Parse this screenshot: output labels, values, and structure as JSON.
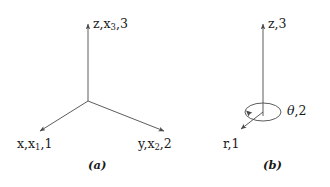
{
  "figure": {
    "background_color": "#ffffff",
    "line_color": "#4a4a4a",
    "text_color": "#1a1a1a"
  },
  "panel_a": {
    "caption": "(a)",
    "system": "cartesian",
    "axes": [
      {
        "name": "z-axis",
        "label_parts": {
          "pre": "z,x",
          "sub": "3",
          "post": ",3"
        },
        "label_text": "z,x3,3",
        "direction": "up"
      },
      {
        "name": "x-axis",
        "label_parts": {
          "pre": "x,x",
          "sub": "1",
          "post": ",1"
        },
        "label_text": "x,x1,1",
        "direction": "down-left"
      },
      {
        "name": "y-axis",
        "label_parts": {
          "pre": "y,x",
          "sub": "2",
          "post": ",2"
        },
        "label_text": "y,x2,2",
        "direction": "down-right"
      }
    ],
    "labels": {
      "z": {
        "pre": "z,x",
        "sub": "3",
        "post": ",3"
      },
      "x": {
        "pre": "x,x",
        "sub": "1",
        "post": ",1"
      },
      "y": {
        "pre": "y,x",
        "sub": "2",
        "post": ",2"
      }
    }
  },
  "panel_b": {
    "caption": "(b)",
    "system": "cylindrical",
    "axes": [
      {
        "name": "z-axis",
        "label_text": "z,3",
        "direction": "up"
      },
      {
        "name": "theta-axis",
        "label_text": "θ,2",
        "direction": "azimuthal"
      },
      {
        "name": "r-axis",
        "label_text": "r,1",
        "direction": "down-left"
      }
    ],
    "labels": {
      "z": "z,3",
      "theta_symbol": "θ",
      "theta_suffix": ",2",
      "r": "r,1"
    }
  }
}
